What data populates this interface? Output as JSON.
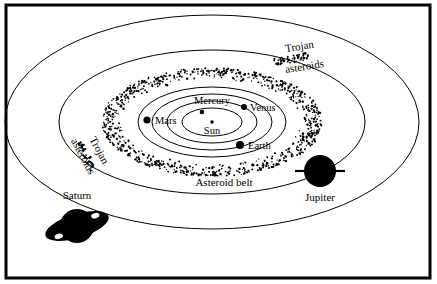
{
  "figure": {
    "kind": "solar-system-diagram",
    "background_color": "#ffffff",
    "ink_color": "#000000",
    "frame": {
      "x": 6,
      "y": 5,
      "width": 424,
      "height": 273,
      "stroke_width": 3
    }
  },
  "center": {
    "x": 212,
    "y": 122
  },
  "orbits": [
    {
      "name": "mercury-orbit",
      "rx": 30,
      "ry": 14
    },
    {
      "name": "venus-orbit",
      "rx": 45,
      "ry": 21
    },
    {
      "name": "earth-orbit",
      "rx": 60,
      "ry": 28
    },
    {
      "name": "mars-orbit",
      "rx": 74,
      "ry": 35
    },
    {
      "name": "jupiter-orbit",
      "rx": 153,
      "ry": 72
    },
    {
      "name": "saturn-orbit",
      "rx": 207,
      "ry": 107
    }
  ],
  "asteroid_belt": {
    "name": "asteroid-belt",
    "inner_rx": 88,
    "inner_ry": 42,
    "outer_rx": 110,
    "outer_ry": 54,
    "dot_count": 900,
    "dot_radius": 0.85,
    "label": "Asteroid belt"
  },
  "bodies": [
    {
      "name": "sun",
      "label": "Sun",
      "x": 212,
      "y": 122,
      "r": 1.8,
      "label_x": 212,
      "label_y": 134,
      "label_anchor": "middle",
      "font_size": 10.5
    },
    {
      "name": "mercury",
      "label": "Mercury",
      "x": 202,
      "y": 112,
      "r": 2.3,
      "label_x": 212,
      "label_y": 104,
      "label_anchor": "middle",
      "font_size": 10.5
    },
    {
      "name": "venus",
      "label": "Venus",
      "x": 244,
      "y": 107,
      "r": 3.0,
      "label_x": 250,
      "label_y": 111,
      "label_anchor": "start",
      "font_size": 10.5
    },
    {
      "name": "earth",
      "label": "Earth",
      "x": 240,
      "y": 145,
      "r": 4.0,
      "label_x": 248,
      "label_y": 149,
      "label_anchor": "start",
      "font_size": 10.5
    },
    {
      "name": "mars",
      "label": "Mars",
      "x": 147,
      "y": 120,
      "r": 3.6,
      "label_x": 155,
      "label_y": 124,
      "label_anchor": "start",
      "font_size": 10.5
    }
  ],
  "jupiter": {
    "name": "jupiter",
    "label": "Jupiter",
    "x": 320,
    "y": 171,
    "r": 16,
    "bar_half_width": 25,
    "bar_thickness": 2.2,
    "label_x": 320,
    "label_y": 201,
    "font_size": 11
  },
  "saturn": {
    "name": "saturn",
    "label": "Saturn",
    "x": 77,
    "y": 226,
    "r": 17,
    "ring_rx": 33,
    "ring_ry": 12,
    "ring_rotation": -17,
    "label_x": 77,
    "label_y": 199,
    "font_size": 11
  },
  "trojan_labels": [
    {
      "name": "trojan-asteroids-upper-right",
      "line1": "Trojan",
      "line2": "asteroids",
      "line1_x": 300,
      "line1_y": 50,
      "line2_x": 305,
      "line2_y": 70,
      "rotation": -9,
      "font_size": 11,
      "clump": {
        "x": 292,
        "y": 59,
        "width": 36,
        "height": 7,
        "dots": 46,
        "rotation": -10
      }
    },
    {
      "name": "trojan-asteroids-lower-left",
      "line1": "Trojan",
      "line2": "asteroids",
      "line1_x": 96,
      "line1_y": 152,
      "line2_x": 80,
      "line2_y": 158,
      "rotation": 62,
      "font_size": 11,
      "clump": {
        "x": 86,
        "y": 156,
        "width": 30,
        "height": 7,
        "dots": 38,
        "rotation": 62
      }
    }
  ],
  "asteroid_belt_label": {
    "name": "asteroid-belt-label",
    "text": "Asteroid belt",
    "x": 224,
    "y": 186,
    "font_size": 11
  }
}
